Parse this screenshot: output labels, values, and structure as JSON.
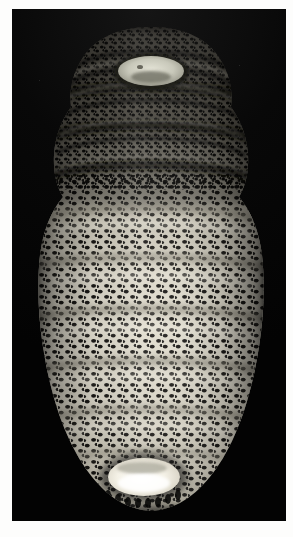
{
  "image": {
    "kind": "photograph",
    "subject": "fly larva (maggot) specimen, whole body, ventral view",
    "background_color": "#050505",
    "page_background": "#fdfdfc",
    "caption_text": ""
  },
  "plate": {
    "label": "specimen-photograph",
    "left": 12,
    "top": 9,
    "width": 274,
    "height": 512
  },
  "specimen": {
    "orientation": "anterior at top, posterior at bottom",
    "cuticle_color": "#d9d6cc",
    "highlight_color": "#f2efe6",
    "spine_color": "#100f0d",
    "shadow_color": "#2a2723",
    "anterior_plate_color": "#cfd0c3",
    "posterior_plate_color": "#f7f5ec",
    "segments": [
      {
        "name": "cephalic-segment",
        "y": 24,
        "height": 46,
        "shade": "dark"
      },
      {
        "name": "thoracic-segment-1",
        "y": 70,
        "height": 38,
        "shade": "dark"
      },
      {
        "name": "thoracic-segment-2",
        "y": 108,
        "height": 40,
        "shade": "dark"
      },
      {
        "name": "thoracic-segment-3",
        "y": 148,
        "height": 40,
        "shade": "medium"
      },
      {
        "name": "abdominal-segment-1",
        "y": 188,
        "height": 48,
        "shade": "pale"
      },
      {
        "name": "abdominal-segment-2",
        "y": 236,
        "height": 52,
        "shade": "pale"
      },
      {
        "name": "abdominal-segment-3",
        "y": 288,
        "height": 52,
        "shade": "pale"
      },
      {
        "name": "abdominal-segment-4",
        "y": 340,
        "height": 50,
        "shade": "pale"
      },
      {
        "name": "abdominal-segment-5",
        "y": 390,
        "height": 44,
        "shade": "pale"
      },
      {
        "name": "terminal-segment",
        "y": 434,
        "height": 46,
        "shade": "pale"
      }
    ],
    "features": [
      {
        "name": "cephalic-aperture",
        "description": "pale oval mouth / cephalic opening at anterior tip"
      },
      {
        "name": "posterior-spiracular-plate",
        "description": "bright white oval plate at posterior tip"
      },
      {
        "name": "spine-bands",
        "description": "dense dark cuticular spines arranged in transverse bands on every segment"
      }
    ]
  }
}
